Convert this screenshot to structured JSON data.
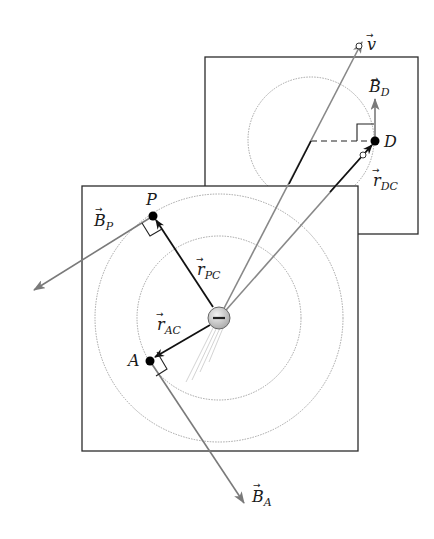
{
  "diagram": {
    "charge": {
      "symbol": "−",
      "sign": "negative"
    },
    "labels": {
      "v": {
        "arrow": "⃗",
        "base": "v",
        "sub": ""
      },
      "B_D": {
        "base": "B",
        "sub": "D"
      },
      "D": {
        "base": "D"
      },
      "r_DC": {
        "base": "r",
        "sub": "DC"
      },
      "P": {
        "base": "P"
      },
      "B_P": {
        "base": "B",
        "sub": "P"
      },
      "r_PC": {
        "base": "r",
        "sub": "PC"
      },
      "r_AC": {
        "base": "r",
        "sub": "AC"
      },
      "A": {
        "base": "A"
      },
      "B_A": {
        "base": "B",
        "sub": "A"
      }
    },
    "colors": {
      "frame": "#2b2b2b",
      "vector_black": "#111111",
      "vector_gray": "#7a7a7a",
      "circle_dotted": "#9a9a9a",
      "charge_fill": "#cfcfcf"
    }
  }
}
